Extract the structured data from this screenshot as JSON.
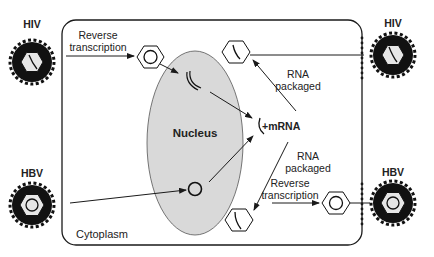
{
  "diagram": {
    "compartments": {
      "cell": "Cytoplasm",
      "nucleus": "Nucleus"
    },
    "viruses": {
      "hiv_in": "HIV",
      "hiv_out": "HIV",
      "hbv_in": "HBV",
      "hbv_out": "HBV"
    },
    "labels": {
      "reverse_transcription_top_1": "Reverse",
      "reverse_transcription_top_2": "transcription",
      "rna_packaged_top_1": "RNA",
      "rna_packaged_top_2": "packaged",
      "mrna": "+mRNA",
      "rna_packaged_bottom_1": "RNA",
      "rna_packaged_bottom_2": "packaged",
      "reverse_transcription_bottom_1": "Reverse",
      "reverse_transcription_bottom_2": "transcription"
    },
    "colors": {
      "line": "#1a1a1a",
      "nucleus_fill": "#d9d9d9",
      "capsid_fill": "#e6e6e6",
      "envelope": "#111111"
    }
  }
}
